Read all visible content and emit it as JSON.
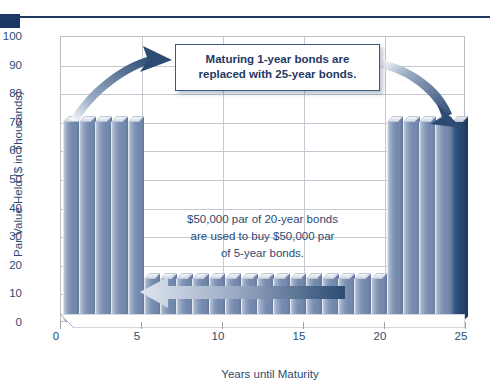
{
  "chart_data": {
    "type": "bar",
    "title": "",
    "xlabel": "Years until Maturity",
    "ylabel": "Par Value Held ($ in Thousands)",
    "xlim": [
      0,
      25
    ],
    "ylim": [
      0,
      100
    ],
    "ytick_labels": [
      "0",
      "10",
      "20",
      "30",
      "40",
      "50",
      "60",
      "70",
      "80",
      "90",
      "100"
    ],
    "ytick_values": [
      0,
      10,
      20,
      30,
      40,
      50,
      60,
      70,
      80,
      90,
      100
    ],
    "xtick_labels": [
      "0",
      "5",
      "10",
      "15",
      "20",
      "25"
    ],
    "xtick_values": [
      0,
      5,
      10,
      15,
      20,
      25
    ],
    "grid": "horizontal and vertical gridlines at major ticks",
    "legend": "none",
    "categories": [
      1,
      2,
      3,
      4,
      5,
      6,
      7,
      8,
      9,
      10,
      11,
      12,
      13,
      14,
      15,
      16,
      17,
      18,
      19,
      20,
      21,
      22,
      23,
      24,
      25
    ],
    "values": [
      70,
      70,
      70,
      70,
      70,
      15,
      15,
      15,
      15,
      15,
      15,
      15,
      15,
      15,
      15,
      15,
      15,
      15,
      15,
      15,
      70,
      70,
      70,
      70,
      70
    ],
    "highlight_index": 24,
    "highlight_label": "25-year bond just purchased",
    "annotations": [
      "Maturing 1-year bonds are replaced with 25-year bonds.",
      "$50,000 par of 20-year bonds are used to buy $50,000 par of 5-year bonds."
    ]
  },
  "header": {
    "rule_color": "#1f3a63",
    "block_color": "#1c3763"
  },
  "axes": {
    "y_title": "Par Value Held ($ in Thousands)",
    "x_title": "Years until Maturity",
    "y_ticks": [
      "100",
      "90",
      "80",
      "70",
      "60",
      "50",
      "40",
      "30",
      "20",
      "10",
      "0"
    ],
    "x_ticks": [
      "0",
      "5",
      "10",
      "15",
      "20",
      "25"
    ]
  },
  "callout": {
    "line1": "Maturing 1-year bonds are",
    "line2": "replaced with 25-year bonds."
  },
  "inner_note": {
    "line1": "$50,000 par of 20-year bonds",
    "line2": "are used to buy $50,000 par",
    "line3": "of 5-year bonds."
  },
  "colors": {
    "bar_light": "#8fa0bc",
    "bar_dark_face": "#6f86ac",
    "bar_highlight": "#2c4a72",
    "text_navy": "#2c4a72",
    "grid": "#c3c8d1"
  },
  "arrows": {
    "left_curved": "curved-arrow-up-right",
    "right_curved": "curved-arrow-down-right",
    "bottom_straight": "arrow-left"
  }
}
